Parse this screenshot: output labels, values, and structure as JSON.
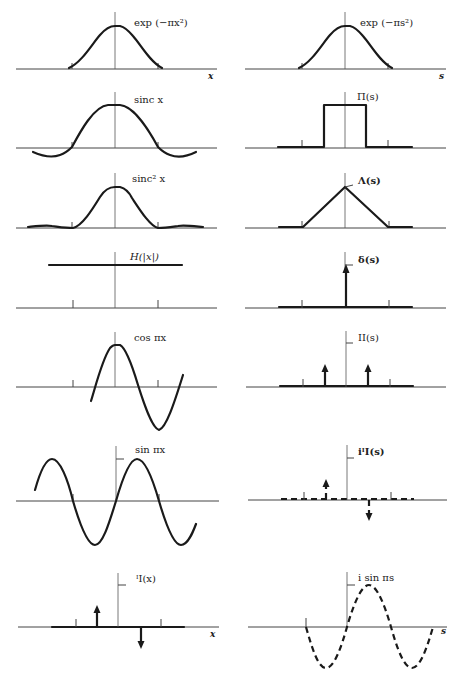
{
  "figure": {
    "left_column_title": "Functions f(x)",
    "right_column_title": "Fourier transforms F(s)",
    "left_axis_label": "x",
    "right_axis_label": "s",
    "pairs": [
      {
        "left": "exp (−πx²)",
        "right": "exp (−πs²)"
      },
      {
        "left": "sinc x",
        "right": "Π(s)"
      },
      {
        "left": "sinc² x",
        "right": "Λ(s)"
      },
      {
        "left": "H(|x|)",
        "right": "δ(s)"
      },
      {
        "left": "cos πx",
        "right": "II(s)"
      },
      {
        "left": "sin πx",
        "right": "i ½I_I(s)"
      },
      {
        "left": "½I_I(x)",
        "right": "i sin πs"
      }
    ]
  },
  "labels": {
    "l0": "exp (−πx²)",
    "l1": "sinc x",
    "l2": "sinc² x",
    "l3": "H(|x|)",
    "l4": "cos πx",
    "l5": "sin πx",
    "l6": "ᴵI(x)",
    "r0": "exp (−πs²)",
    "r1": "Π(s)",
    "r2": "Λ(s)",
    "r3": "δ(s)",
    "r4": "II(s)",
    "r5": "iᴵI(s)",
    "r6": "i  sin  πs",
    "x_axis": "x",
    "s_axis": "s"
  },
  "colors": {
    "ink": "#1a1a1a",
    "axis": "#444444",
    "background": "#ffffff"
  }
}
